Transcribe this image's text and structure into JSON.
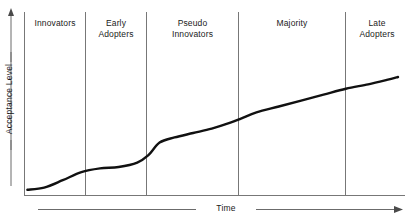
{
  "chart_data": {
    "type": "line",
    "title": "",
    "xlabel": "Time",
    "ylabel": "Acceptance Level",
    "grid": false,
    "legend": false,
    "axis_arrows": true,
    "xlim": [
      0,
      100
    ],
    "ylim": [
      0,
      100
    ],
    "x_tick_labels": [],
    "y_tick_labels": [],
    "segments": [
      {
        "label": "Innovators",
        "x_start": 0,
        "x_end": 16.6
      },
      {
        "label": "Early\nAdopters",
        "x_start": 16.6,
        "x_end": 33.2
      },
      {
        "label": "Pseudo\nInnovators",
        "x_start": 33.2,
        "x_end": 58.2
      },
      {
        "label": "Majority",
        "x_start": 58.2,
        "x_end": 87.3
      },
      {
        "label": "Late\nAdopters",
        "x_start": 87.3,
        "x_end": 100
      }
    ],
    "series": [
      {
        "name": "Adoption curve",
        "x": [
          0.5,
          5,
          10,
          15,
          20,
          25,
          30,
          33,
          36,
          40,
          45,
          50,
          55,
          58,
          62,
          68,
          74,
          80,
          86,
          92,
          97,
          100
        ],
        "y": [
          2.5,
          4,
          9,
          14.5,
          17,
          18,
          21,
          26,
          34.5,
          38,
          41,
          44,
          48,
          51,
          55,
          59,
          63,
          67,
          71,
          74,
          77,
          79
        ]
      }
    ],
    "annotations": []
  },
  "axes": {
    "y_title": "Acceptance Level",
    "x_title": "Time"
  },
  "colors": {
    "curve": "#111111",
    "axis": "#6b6b6b",
    "divider": "#777777",
    "text": "#1a1a1a",
    "background": "#ffffff"
  }
}
